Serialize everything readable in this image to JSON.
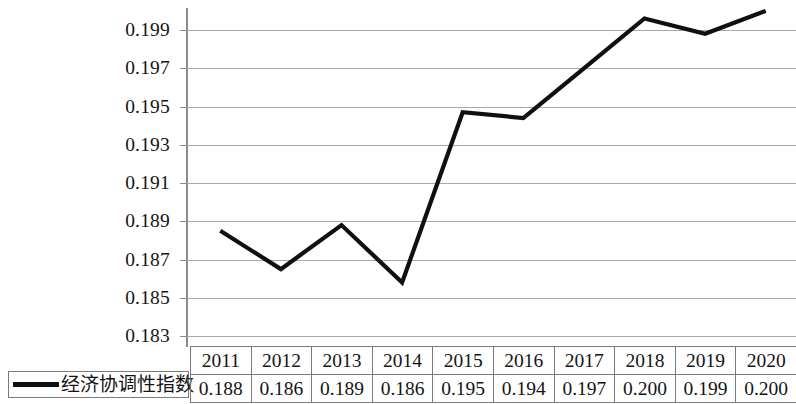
{
  "chart_data": {
    "type": "line",
    "title": "",
    "xlabel": "",
    "ylabel": "",
    "categories": [
      "2011",
      "2012",
      "2013",
      "2014",
      "2015",
      "2016",
      "2017",
      "2018",
      "2019",
      "2020"
    ],
    "series": [
      {
        "name": "经济协调性指数",
        "values": [
          0.1885,
          0.1865,
          0.1888,
          0.1858,
          0.1947,
          0.1944,
          0.197,
          0.1996,
          0.1988,
          0.2
        ],
        "table_values": [
          "0.188",
          "0.186",
          "0.189",
          "0.186",
          "0.195",
          "0.194",
          "0.197",
          "0.200",
          "0.199",
          "0.200"
        ],
        "color": "#101010"
      }
    ],
    "ylim": [
      0.183,
      0.2005
    ],
    "y_ticks": [
      "0.199",
      "0.197",
      "0.195",
      "0.193",
      "0.191",
      "0.189",
      "0.187",
      "0.185",
      "0.183"
    ],
    "y_tick_values": [
      0.199,
      0.197,
      0.195,
      0.193,
      0.191,
      0.189,
      0.187,
      0.185,
      0.183
    ],
    "grid": true,
    "grid_color": "#a8a8a8",
    "axis_color": "#8d8d8d",
    "legend_position": "bottom-left"
  },
  "legend": {
    "label": "经济协调性指数",
    "marker": "line-marker"
  },
  "table": {
    "header": [
      "2011",
      "2012",
      "2013",
      "2014",
      "2015",
      "2016",
      "2017",
      "2018",
      "2019",
      "2020"
    ],
    "row": [
      "0.188",
      "0.186",
      "0.189",
      "0.186",
      "0.195",
      "0.194",
      "0.197",
      "0.200",
      "0.199",
      "0.200"
    ]
  }
}
